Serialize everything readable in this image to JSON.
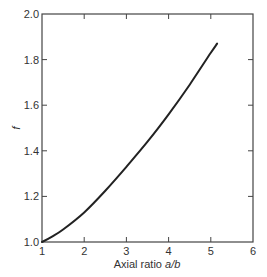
{
  "chart_data": {
    "type": "line",
    "title": "",
    "xlabel": "Axial ratio a/b",
    "xlabel_parts": {
      "text": "Axial ratio ",
      "italic": "a/b"
    },
    "ylabel": "f",
    "xlim": [
      1,
      6
    ],
    "ylim": [
      1.0,
      2.0
    ],
    "x_ticks": [
      1,
      2,
      3,
      4,
      5,
      6
    ],
    "x_tick_labels": [
      "1",
      "2",
      "3",
      "4",
      "5",
      "6"
    ],
    "y_ticks": [
      1.0,
      1.2,
      1.4,
      1.6,
      1.8,
      2.0
    ],
    "y_tick_labels": [
      "1.0",
      "1.2",
      "1.4",
      "1.6",
      "1.8",
      "2.0"
    ],
    "grid": false,
    "legend": null,
    "frame": "box with inward ticks on all sides",
    "series": [
      {
        "name": "f",
        "color": "#222222",
        "x": [
          1.0,
          1.25,
          1.5,
          2.0,
          2.5,
          3.0,
          3.5,
          4.0,
          4.5,
          5.0,
          5.15
        ],
        "y": [
          1.0,
          1.025,
          1.055,
          1.13,
          1.225,
          1.33,
          1.44,
          1.56,
          1.69,
          1.83,
          1.87
        ]
      }
    ]
  }
}
